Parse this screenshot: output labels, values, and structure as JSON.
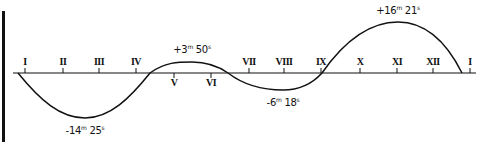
{
  "diagram": {
    "months": [
      {
        "label": "I",
        "x": 25,
        "pos": "above"
      },
      {
        "label": "II",
        "x": 63,
        "pos": "above"
      },
      {
        "label": "III",
        "x": 99,
        "pos": "above"
      },
      {
        "label": "IV",
        "x": 136,
        "pos": "above"
      },
      {
        "label": "V",
        "x": 174,
        "pos": "below"
      },
      {
        "label": "VI",
        "x": 211,
        "pos": "below"
      },
      {
        "label": "VII",
        "x": 249,
        "pos": "above"
      },
      {
        "label": "VIII",
        "x": 284,
        "pos": "above"
      },
      {
        "label": "IX",
        "x": 321,
        "pos": "above"
      },
      {
        "label": "X",
        "x": 360,
        "pos": "above"
      },
      {
        "label": "XI",
        "x": 397,
        "pos": "above"
      },
      {
        "label": "XII",
        "x": 433,
        "pos": "above"
      },
      {
        "label": "I",
        "x": 470,
        "pos": "above"
      }
    ],
    "extrema": [
      {
        "sign": "-",
        "min": "14",
        "sec": "25",
        "x": 85,
        "y": 118,
        "label_y": 126
      },
      {
        "sign": "+",
        "min": "3",
        "sec": "50",
        "x": 192,
        "y": 62,
        "label_y": 45
      },
      {
        "sign": "-",
        "min": "6",
        "sec": "18",
        "x": 283,
        "y": 90,
        "label_y": 98
      },
      {
        "sign": "+",
        "min": "16",
        "sec": "21",
        "x": 398,
        "y": 22,
        "label_y": 6
      }
    ],
    "unit_min": "m",
    "unit_sec": "s",
    "axis": {
      "x_start": 13,
      "x_end": 476,
      "y": 73
    },
    "colors": {
      "line": "#111111",
      "background": "#ffffff"
    }
  }
}
